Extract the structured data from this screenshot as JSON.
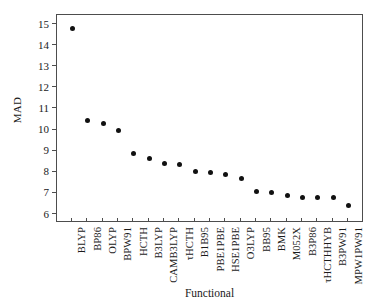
{
  "chart_data": {
    "type": "scatter",
    "title": "",
    "xlabel": "Functional",
    "ylabel": "MAD",
    "ylim": [
      5.6,
      15.45
    ],
    "yticks": [
      6,
      7,
      8,
      9,
      10,
      11,
      12,
      13,
      14,
      15
    ],
    "ytick_labels": [
      "6",
      "7",
      "8",
      "9",
      "10",
      "11",
      "12",
      "13",
      "14",
      "15"
    ],
    "grid": false,
    "legend": false,
    "marker": "filled-circle",
    "marker_color": "#111111",
    "categories": [
      "BLYP",
      "BP86",
      "OLYP",
      "BPW91",
      "HCTH",
      "B3LYP",
      "CAMB3LYP",
      "τHCTH",
      "B1B95",
      "PBE1PBE",
      "HSE1PBE",
      "O3LYP",
      "BB95",
      "BMK",
      "M052X",
      "B3P86",
      "τHCTHHYB",
      "B3PW91",
      "MPW1PW91"
    ],
    "values": [
      14.82,
      10.47,
      10.32,
      9.99,
      8.88,
      8.64,
      8.4,
      8.38,
      8.02,
      8.0,
      7.88,
      7.73,
      7.07,
      7.04,
      6.91,
      6.83,
      6.8,
      6.79,
      6.45
    ]
  },
  "axis": {
    "y_title": "MAD",
    "x_title": "Functional"
  }
}
